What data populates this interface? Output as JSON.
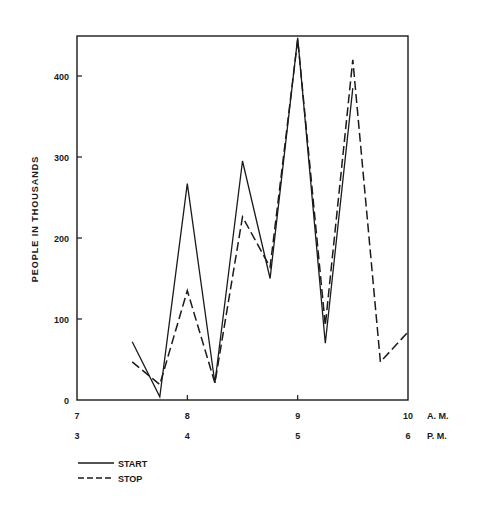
{
  "chart_data": {
    "type": "line",
    "title": "",
    "ylabel": "PEOPLE IN THOUSANDS",
    "xlabel": "",
    "ylim": [
      0,
      445
    ],
    "xlim": [
      7,
      10
    ],
    "yticks": [
      0,
      100,
      200,
      300,
      400
    ],
    "ytick_labels": [
      "0",
      "100",
      "200",
      "300",
      "400"
    ],
    "xticks": [
      7,
      8,
      9,
      10
    ],
    "xtick_labels_am": [
      "7",
      "8",
      "9",
      "10"
    ],
    "xtick_labels_pm": [
      "3",
      "4",
      "5",
      "6"
    ],
    "am_suffix": "A. M.",
    "pm_suffix": "P. M.",
    "grid": false,
    "legend_position": "bottom-left",
    "series": [
      {
        "name": "START",
        "style": "solid",
        "x": [
          7.5,
          7.75,
          8.0,
          8.25,
          8.5,
          8.75,
          9.0,
          9.25,
          9.5
        ],
        "values": [
          72,
          4,
          267,
          21,
          295,
          150,
          447,
          70,
          385
        ]
      },
      {
        "name": "STOP",
        "style": "dashed",
        "x": [
          7.5,
          7.75,
          8.0,
          8.25,
          8.5,
          8.75,
          9.0,
          9.25,
          9.5,
          9.75,
          10.0
        ],
        "values": [
          47,
          19,
          135,
          21,
          226,
          164,
          445,
          92,
          420,
          47,
          84
        ]
      }
    ]
  },
  "legend": {
    "start_label": "START",
    "stop_label": "STOP"
  },
  "colors": {
    "ink": "#1a1a1a",
    "background": "#ffffff"
  }
}
